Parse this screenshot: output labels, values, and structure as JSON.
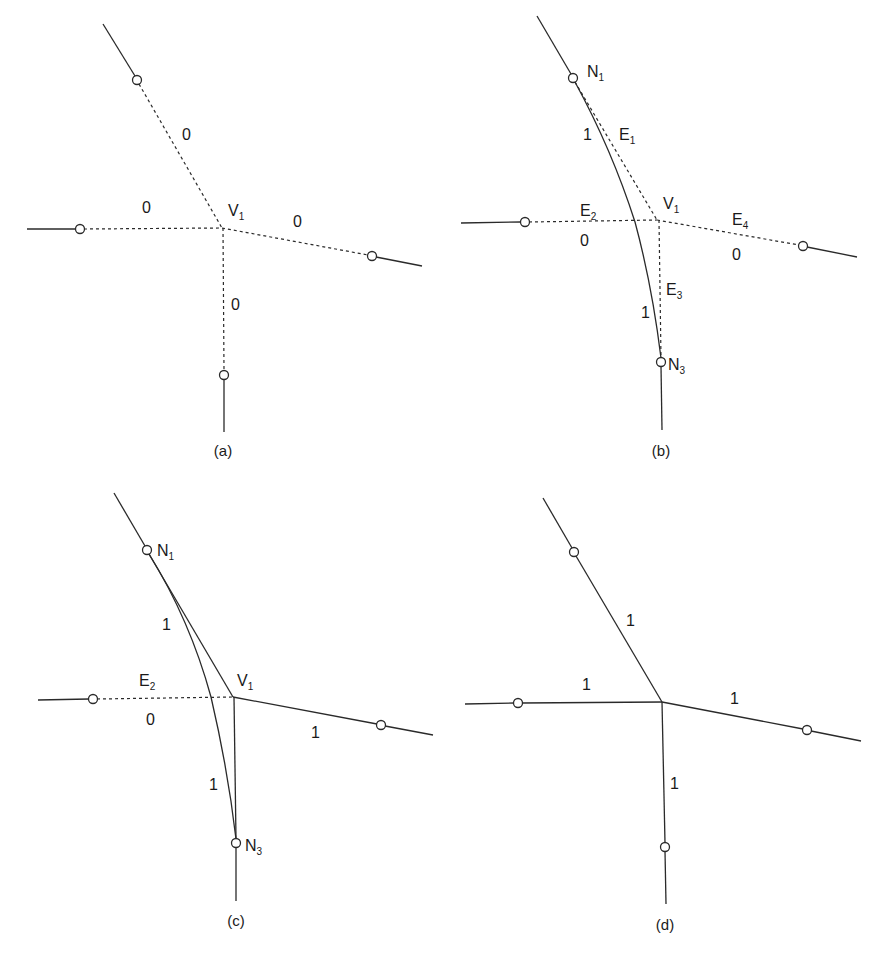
{
  "figure": {
    "panels": [
      {
        "caption": "(a)",
        "vertex": {
          "name": "V",
          "sub": "1"
        },
        "edge_weights": [
          "0",
          "0",
          "0",
          "0"
        ],
        "edge_style": "dashed"
      },
      {
        "caption": "(b)",
        "vertex": {
          "name": "V",
          "sub": "1"
        },
        "nodes": [
          {
            "name": "N",
            "sub": "1"
          },
          {
            "name": "N",
            "sub": "3"
          }
        ],
        "edges": [
          {
            "name": "E",
            "sub": "1"
          },
          {
            "name": "E",
            "sub": "2"
          },
          {
            "name": "E",
            "sub": "3"
          },
          {
            "name": "E",
            "sub": "4"
          }
        ],
        "curve_weights": [
          "1",
          "1"
        ],
        "edge_weights": [
          "0",
          "0"
        ]
      },
      {
        "caption": "(c)",
        "vertex": {
          "name": "V",
          "sub": "1"
        },
        "nodes": [
          {
            "name": "N",
            "sub": "1"
          },
          {
            "name": "N",
            "sub": "3"
          }
        ],
        "edges": [
          {
            "name": "E",
            "sub": "2"
          }
        ],
        "weights": [
          "1",
          "0",
          "1",
          "1"
        ]
      },
      {
        "caption": "(d)",
        "edge_weights": [
          "1",
          "1",
          "1",
          "1"
        ],
        "edge_style": "solid"
      }
    ]
  }
}
